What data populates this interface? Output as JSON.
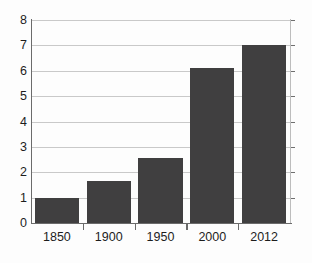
{
  "chart_data": {
    "type": "bar",
    "title": "",
    "subtitle": "",
    "xlabel": "",
    "ylabel": "",
    "categories": [
      "1850",
      "1900",
      "1950",
      "2000",
      "2012"
    ],
    "values": [
      1.0,
      1.65,
      2.55,
      6.1,
      7.0
    ],
    "ylim": [
      0,
      8
    ],
    "yticks": [
      "0",
      "1",
      "2",
      "3",
      "4",
      "5",
      "6",
      "7",
      "8"
    ],
    "ytick_values": [
      0,
      1,
      2,
      3,
      4,
      5,
      6,
      7,
      8
    ],
    "grid": "horizontal",
    "legend": "none",
    "annotations": [],
    "colors": {
      "bar_fill": "#403f40",
      "gridline": "#c9c9c9",
      "axis": "#6b6b6b",
      "background": "#fdfdfd",
      "text": "#1d1d1d"
    }
  }
}
